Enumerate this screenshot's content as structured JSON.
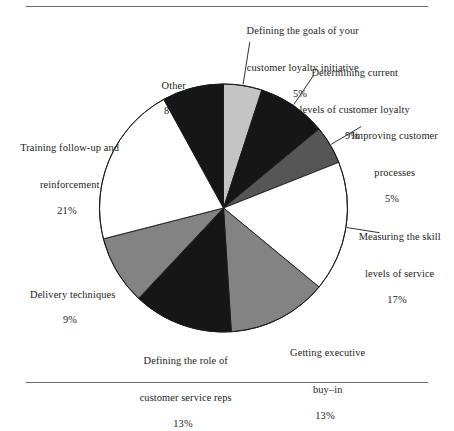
{
  "figure": {
    "has_top_rule": true,
    "has_bottom_rule": true,
    "rule_color": "#6b6b6b",
    "background": "#ffffff",
    "outline_color": "#1a1a1a"
  },
  "chart_data": {
    "type": "pie",
    "title": "",
    "subtitle": "",
    "xlabel": "",
    "ylabel": "",
    "legend_position": "none",
    "grid": false,
    "labels_outside": true,
    "leader_lines": true,
    "start_angle_deg": 0,
    "direction": "clockwise",
    "total": 100,
    "units": "%",
    "categories": [
      "Defining the goals of your customer loyalty initiative",
      "Determining current levels of customer loyalty",
      "Improving customer processes",
      "Measuring the skill levels of service",
      "Getting executive buy-in",
      "Defining the role of customer service reps",
      "Delivery techniques",
      "Training follow-up and reinforcement",
      "Other"
    ],
    "values": [
      5,
      9,
      5,
      17,
      13,
      13,
      9,
      21,
      8
    ],
    "value_labels": [
      "5%",
      "9%",
      "5%",
      "17%",
      "13%",
      "13%",
      "9%",
      "21%",
      "8%"
    ],
    "colors": [
      "#c4c4c4",
      "#161616",
      "#565656",
      "#ffffff",
      "#838383",
      "#161616",
      "#838383",
      "#ffffff",
      "#161616"
    ],
    "slices": [
      {
        "name": "defining-goals",
        "label_lines": [
          "Defining the goals of your",
          "customer loyalty initiative"
        ],
        "percent_label": "5%",
        "value": 5,
        "color": "#c4c4c4",
        "align": "center"
      },
      {
        "name": "determining-current-levels",
        "label_lines": [
          "Determining current",
          "levels of customer loyalty"
        ],
        "percent_label": "9%",
        "value": 9,
        "color": "#161616",
        "align": "center"
      },
      {
        "name": "improving-customer-processes",
        "label_lines": [
          "Improving customer",
          "processes"
        ],
        "percent_label": "5%",
        "value": 5,
        "color": "#565656",
        "align": "center"
      },
      {
        "name": "measuring-skill-levels",
        "label_lines": [
          "Measuring the skill",
          "levels of service"
        ],
        "percent_label": "17%",
        "value": 17,
        "color": "#ffffff",
        "align": "center"
      },
      {
        "name": "getting-executive-buy-in",
        "label_lines": [
          "Getting executive",
          "buy–in"
        ],
        "percent_label": "13%",
        "value": 13,
        "color": "#838383",
        "align": "center"
      },
      {
        "name": "defining-role-of-reps",
        "label_lines": [
          "Defining the role of",
          "customer service reps"
        ],
        "percent_label": "13%",
        "value": 13,
        "color": "#161616",
        "align": "center"
      },
      {
        "name": "delivery-techniques",
        "label_lines": [
          "Delivery techniques"
        ],
        "percent_label": "9%",
        "value": 9,
        "color": "#838383",
        "align": "center"
      },
      {
        "name": "training-follow-up",
        "label_lines": [
          "Training follow-up and",
          "reinforcement"
        ],
        "percent_label": "21%",
        "value": 21,
        "color": "#ffffff",
        "align": "center"
      },
      {
        "name": "other",
        "label_lines": [
          "Other"
        ],
        "percent_label": "8%",
        "value": 8,
        "color": "#161616",
        "align": "center"
      }
    ]
  }
}
